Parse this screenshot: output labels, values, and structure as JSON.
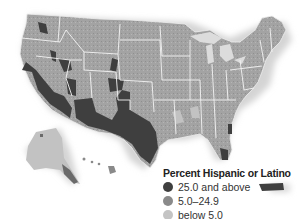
{
  "map": {
    "subject": "United States counties",
    "legend": {
      "title": "Percent Hispanic or Latino",
      "items": [
        {
          "label": "25.0 and above",
          "color": "#3f3f3f"
        },
        {
          "label": "5.0–24.9",
          "color": "#8a8a8a"
        },
        {
          "label": "below 5.0",
          "color": "#c4c4c4"
        }
      ]
    },
    "colors": {
      "high": "#3f3f3f",
      "mid": "#8a8a8a",
      "low": "#a9a9a9",
      "border": "#f2f2f2",
      "shadow": "#d8d8d8"
    }
  }
}
